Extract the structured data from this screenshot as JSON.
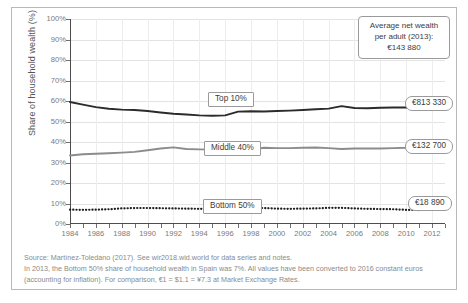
{
  "chart_data": {
    "type": "line",
    "title": "",
    "xlabel": "",
    "ylabel": "Share of household wealth (%)",
    "ylim": [
      0,
      100
    ],
    "xlim": [
      1984,
      2013
    ],
    "grid": true,
    "legend_position": "inline-labels",
    "ytick_labels": [
      "0%",
      "10%",
      "20%",
      "30%",
      "40%",
      "50%",
      "60%",
      "70%",
      "80%",
      "90%",
      "100%"
    ],
    "ytick_values": [
      0,
      10,
      20,
      30,
      40,
      50,
      60,
      70,
      80,
      90,
      100
    ],
    "xtick_labels": [
      "1984",
      "1986",
      "1988",
      "1990",
      "1992",
      "1994",
      "1996",
      "1998",
      "2000",
      "2002",
      "2004",
      "2006",
      "2008",
      "2010",
      "2012"
    ],
    "xtick_values": [
      1984,
      1986,
      1988,
      1990,
      1992,
      1994,
      1996,
      1998,
      2000,
      2002,
      2004,
      2006,
      2008,
      2010,
      2012
    ],
    "x": [
      1984,
      1985,
      1986,
      1987,
      1988,
      1989,
      1990,
      1991,
      1992,
      1993,
      1994,
      1995,
      1996,
      1997,
      1998,
      1999,
      2000,
      2001,
      2002,
      2003,
      2004,
      2005,
      2006,
      2007,
      2008,
      2009,
      2010,
      2011,
      2012,
      2013
    ],
    "series": [
      {
        "name": "Top 10%",
        "color": "#2b2b2b",
        "style": "solid",
        "end_value_label": "€813 330",
        "values": [
          59.5,
          58.2,
          57.0,
          56.2,
          55.8,
          55.6,
          55.1,
          54.4,
          53.8,
          53.4,
          53.0,
          52.8,
          53.0,
          54.8,
          55.0,
          54.9,
          55.1,
          55.3,
          55.6,
          56.0,
          56.3,
          57.5,
          56.6,
          56.5,
          56.7,
          56.8,
          56.8,
          56.8,
          56.8,
          56.5
        ]
      },
      {
        "name": "Middle 40%",
        "color": "#8c8c8c",
        "style": "solid",
        "end_value_label": "€132 700",
        "values": [
          33.4,
          34.0,
          34.3,
          34.5,
          34.8,
          35.2,
          36.0,
          36.8,
          37.4,
          36.6,
          36.4,
          36.3,
          36.0,
          35.4,
          36.2,
          37.2,
          37.0,
          37.0,
          37.2,
          37.3,
          37.0,
          36.6,
          36.8,
          36.9,
          36.8,
          37.0,
          37.2,
          37.6,
          37.8,
          38.0
        ]
      },
      {
        "name": "Bottom 50%",
        "color": "#1f1f1f",
        "style": "dotted",
        "end_value_label": "€18 890",
        "values": [
          7.0,
          6.9,
          7.0,
          7.2,
          7.6,
          7.8,
          7.8,
          7.7,
          7.6,
          7.5,
          7.4,
          7.4,
          7.6,
          7.8,
          7.9,
          7.8,
          7.5,
          7.4,
          7.5,
          7.6,
          7.9,
          7.9,
          7.6,
          7.4,
          7.3,
          7.2,
          6.9,
          6.8,
          6.9,
          7.0
        ]
      }
    ],
    "annotations": [
      {
        "name": "average-net-wealth",
        "line1": "Average net wealth",
        "line2": "per adult (2013):",
        "line3": "€143 880"
      }
    ]
  },
  "notes": {
    "line1": "Source: Martínez-Toledano (2017). See wir2018.wid.world for data series and notes.",
    "line2": "In 2013, the Bottom 50% share of household wealth in Spain was 7%. All values have been converted to 2016 constant euros",
    "line3": "(accounting for inflation). For comparison, €1 = $1.1 = ¥7.3 at Market Exchange Rates."
  }
}
